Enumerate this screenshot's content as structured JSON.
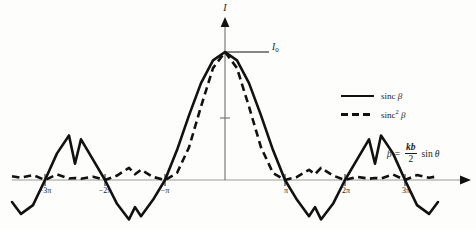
{
  "figure": {
    "background_color": "#fdfdfc",
    "curve_color": "#111111"
  },
  "axes": {
    "y_title": "I",
    "peak_label": "I",
    "peak_label_sub": "0",
    "x_tick_labels": [
      "−3π",
      "−2π",
      "−π",
      "π",
      "2π",
      "3π"
    ],
    "x_tick_values": [
      -3,
      -2,
      -1,
      1,
      2,
      3
    ]
  },
  "legend": {
    "entries": [
      {
        "label_main": "sinc",
        "label_sup": "",
        "label_beta": "β",
        "style": "solid",
        "name": "sinc-beta"
      },
      {
        "label_main": "sinc",
        "label_sup": "2",
        "label_beta": "β",
        "style": "dashed",
        "name": "sinc-squared-beta"
      }
    ]
  },
  "equation": {
    "symbol": "β",
    "equals": "=",
    "numerator": "kb",
    "denominator": "2",
    "trig": "sin",
    "angle": "θ"
  },
  "chart_data": {
    "type": "line",
    "title": "",
    "xlabel": "β = (kb/2) sin θ",
    "ylabel": "I",
    "xlim": [
      -3.6,
      4.0
    ],
    "ylim": [
      -0.31,
      1.12
    ],
    "xtick_labels": [
      "−3π",
      "−2π",
      "−π",
      "π",
      "2π",
      "3π"
    ],
    "xticks_in_pi": [
      -3,
      -2,
      -1,
      1,
      2,
      3
    ],
    "grid": false,
    "legend_position": "right",
    "x_unit": "pi",
    "series": [
      {
        "name": "sinc β",
        "style": "solid",
        "formula": "sin(pi*x)/(pi*x)",
        "x_pi": [
          -3.55,
          -3.4,
          -3.2,
          -3.0,
          -2.8,
          -2.6,
          -2.5,
          -2.4,
          -2.2,
          -2.0,
          -1.8,
          -1.6,
          -1.5,
          -1.4,
          -1.2,
          -1.0,
          -0.8,
          -0.6,
          -0.4,
          -0.2,
          0.0,
          0.2,
          0.4,
          0.6,
          0.8,
          1.0,
          1.2,
          1.4,
          1.5,
          1.6,
          1.8,
          2.0,
          2.2,
          2.4,
          2.5,
          2.6,
          2.8,
          3.0,
          3.2,
          3.4,
          3.55
        ],
        "values": [
          -0.172,
          -0.265,
          -0.196,
          0.0,
          0.208,
          0.348,
          0.127,
          0.318,
          0.159,
          0.0,
          -0.186,
          -0.308,
          -0.212,
          -0.283,
          -0.155,
          0.0,
          0.234,
          0.505,
          0.757,
          0.935,
          1.0,
          0.935,
          0.757,
          0.505,
          0.234,
          0.0,
          -0.155,
          -0.283,
          -0.212,
          -0.308,
          -0.186,
          0.0,
          0.159,
          0.318,
          0.127,
          0.348,
          0.208,
          0.0,
          -0.196,
          -0.265,
          -0.172
        ]
      },
      {
        "name": "sinc² β",
        "style": "dashed",
        "formula": "(sin(pi*x)/(pi*x))^2",
        "x_pi": [
          -3.55,
          -3.4,
          -3.2,
          -3.0,
          -2.8,
          -2.6,
          -2.5,
          -2.4,
          -2.2,
          -2.0,
          -1.8,
          -1.6,
          -1.5,
          -1.4,
          -1.2,
          -1.0,
          -0.8,
          -0.6,
          -0.4,
          -0.2,
          0.0,
          0.2,
          0.4,
          0.6,
          0.8,
          1.0,
          1.2,
          1.4,
          1.5,
          1.6,
          1.8,
          2.0,
          2.2,
          2.4,
          2.5,
          2.6,
          2.8,
          3.0,
          3.2,
          3.4,
          3.55
        ],
        "values": [
          0.0296,
          0.0178,
          0.0384,
          0.0,
          0.0433,
          0.0121,
          0.0162,
          0.0101,
          0.0253,
          0.0,
          0.0346,
          0.0949,
          0.045,
          0.08,
          0.024,
          0.0,
          0.0548,
          0.255,
          0.573,
          0.8742,
          1.0,
          0.8742,
          0.573,
          0.255,
          0.0548,
          0.0,
          0.024,
          0.08,
          0.045,
          0.0949,
          0.0346,
          0.0,
          0.0253,
          0.0101,
          0.0162,
          0.0121,
          0.0433,
          0.0,
          0.0384,
          0.0178,
          0.0296
        ]
      }
    ],
    "annotations": [
      {
        "text": "I₀",
        "at_x_pi": 0,
        "at_y": 1.0,
        "kind": "peak-level-label"
      }
    ]
  }
}
